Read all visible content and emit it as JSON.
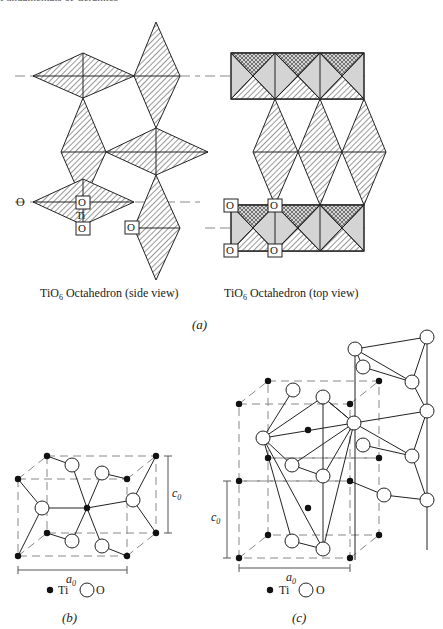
{
  "header": {
    "text": "Fundamentals of Ceramics"
  },
  "panel_a": {
    "caption": "(a)",
    "side_view": {
      "title": "TiO",
      "sub": "6",
      "title_rest": " Octahedron (side view)",
      "labels": {
        "O_left": "O",
        "O_top": "O",
        "Ti": "Ti",
        "O_bottom": "O",
        "O_right": "O"
      }
    },
    "top_view": {
      "title": "TiO",
      "sub": "6",
      "title_rest": " Octahedron (top view)",
      "labels": [
        "O",
        "O",
        "O",
        "O"
      ]
    }
  },
  "panel_b": {
    "caption": "(b)",
    "axis_a": "a",
    "axis_a_sub": "0",
    "axis_c": "c",
    "axis_c_sub": "0",
    "legend": {
      "ti": "Ti",
      "o": "O"
    }
  },
  "panel_c": {
    "caption": "(c)",
    "axis_a": "a",
    "axis_a_sub": "0",
    "axis_c": "c",
    "axis_c_sub": "0",
    "legend": {
      "ti": "Ti",
      "o": "O"
    }
  },
  "colors": {
    "ink": "#222222",
    "shade": "#d4d4d4",
    "paper": "#ffffff"
  }
}
